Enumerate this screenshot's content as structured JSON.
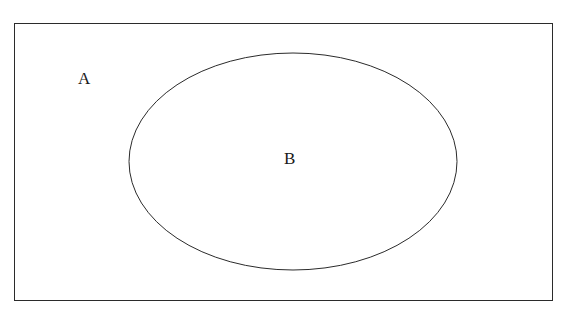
{
  "diagram": {
    "type": "euler-diagram",
    "background_color": "#ffffff",
    "stroke_color": "#2b2b2b",
    "stroke_width": 1,
    "canvas": {
      "width": 568,
      "height": 321
    },
    "shapes": [
      {
        "id": "universal-set-rectangle",
        "shape": "rectangle",
        "label": "A",
        "x": 14,
        "y": 23,
        "width": 539,
        "height": 278,
        "fill": "none",
        "stroke": "#2b2b2b"
      },
      {
        "id": "subset-ellipse",
        "shape": "ellipse",
        "label": "B",
        "cx": 293,
        "cy": 161.5,
        "rx": 164,
        "ry": 108.5,
        "fill": "none",
        "stroke": "#2b2b2b"
      }
    ],
    "labels": [
      {
        "id": "label-universal-set",
        "text": "A",
        "x": 85,
        "y": 78,
        "region": "inside rectangle, outside ellipse",
        "color": "#1a1a1a",
        "font_size": 17
      },
      {
        "id": "label-subset",
        "text": "B",
        "x": 291,
        "y": 158,
        "region": "inside ellipse",
        "color": "#1a1a1a",
        "font_size": 17
      }
    ]
  }
}
